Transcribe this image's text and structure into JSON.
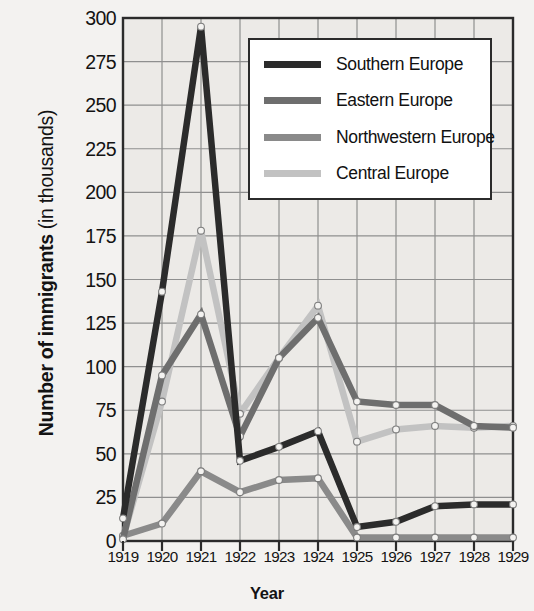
{
  "chart_data": {
    "type": "line",
    "title": "",
    "xlabel": "Year",
    "ylabel_bold": "Number of immigrants",
    "ylabel_plain": "(in thousands)",
    "categories": [
      "1919",
      "1920",
      "1921",
      "1922",
      "1923",
      "1924",
      "1925",
      "1926",
      "1927",
      "1928",
      "1929"
    ],
    "ylim": [
      0,
      300
    ],
    "yticks": [
      "300",
      "275",
      "250",
      "225",
      "200",
      "175",
      "150",
      "125",
      "100",
      "75",
      "50",
      "25",
      "0"
    ],
    "ytick_values": [
      300,
      275,
      250,
      225,
      200,
      175,
      150,
      125,
      100,
      75,
      50,
      25,
      0
    ],
    "grid": true,
    "legend_position": "top-right",
    "series": [
      {
        "name": "Southern Europe",
        "color": "#2b2b2b",
        "values": [
          13,
          143,
          295,
          46,
          54,
          63,
          8,
          11,
          20,
          21,
          21
        ]
      },
      {
        "name": "Eastern Europe",
        "color": "#6e6e6e",
        "values": [
          1,
          95,
          130,
          60,
          105,
          128,
          80,
          78,
          78,
          66,
          65
        ]
      },
      {
        "name": "Northwestern Europe",
        "color": "#8a8a8a",
        "values": [
          3,
          10,
          40,
          28,
          35,
          36,
          2,
          2,
          2,
          2,
          2
        ]
      },
      {
        "name": "Central Europe",
        "color": "#c2c2c2",
        "values": [
          2,
          80,
          178,
          73,
          105,
          135,
          57,
          64,
          66,
          65,
          66
        ]
      }
    ]
  },
  "colors": {
    "background": "#f3f2f0",
    "plot_background": "#eceae7",
    "axis": "#2b2b2b",
    "grid": "#8f8f8f",
    "text": "#131313"
  }
}
